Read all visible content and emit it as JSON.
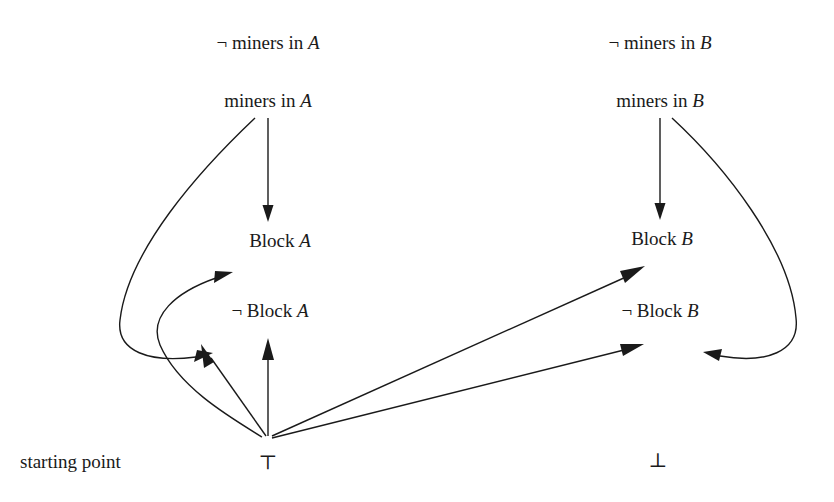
{
  "diagram": {
    "background_color": "#ffffff",
    "ink_color": "#1a1a1a",
    "side_label": "starting point",
    "nodes": [
      {
        "id": "not_miners_a",
        "text_plain": "¬ miners in A",
        "prefix": "¬ miners in ",
        "italic": "A",
        "x": 268,
        "y": 42
      },
      {
        "id": "miners_a",
        "text_plain": "miners in A",
        "prefix": "miners in ",
        "italic": "A",
        "x": 268,
        "y": 100
      },
      {
        "id": "not_miners_b",
        "text_plain": "¬ miners in B",
        "prefix": "¬ miners in ",
        "italic": "B",
        "x": 660,
        "y": 42
      },
      {
        "id": "miners_b",
        "text_plain": "miners in B",
        "prefix": "miners in ",
        "italic": "B",
        "x": 660,
        "y": 100
      },
      {
        "id": "block_a",
        "text_plain": "Block A",
        "prefix": "Block ",
        "italic": "A",
        "x": 280,
        "y": 240
      },
      {
        "id": "not_block_a",
        "text_plain": "¬ Block A",
        "prefix": "¬ Block ",
        "italic": "A",
        "x": 270,
        "y": 310
      },
      {
        "id": "block_b",
        "text_plain": "Block B",
        "prefix": "Block ",
        "italic": "B",
        "x": 662,
        "y": 238
      },
      {
        "id": "not_block_b",
        "text_plain": "¬ Block B",
        "prefix": "¬ Block ",
        "italic": "B",
        "x": 660,
        "y": 310
      },
      {
        "id": "top",
        "text_plain": "⊤",
        "prefix": "⊤",
        "italic": "",
        "x": 268,
        "y": 462
      },
      {
        "id": "bottom",
        "text_plain": "⊥",
        "prefix": "⊥",
        "italic": "",
        "x": 658,
        "y": 460
      }
    ],
    "edges": [
      {
        "id": "edge-miners-a-to-block-a",
        "from": "miners_a",
        "to": "block_a",
        "shape": "straight-vertical"
      },
      {
        "id": "edge-miners-a-to-not-block-a",
        "from": "miners_a",
        "to": "not_block_a",
        "shape": "left-outer-curve"
      },
      {
        "id": "edge-top-to-block-a",
        "from": "top",
        "to": "block_a",
        "shape": "left-inner-curve"
      },
      {
        "id": "edge-top-to-not-block-a-line",
        "from": "top",
        "to": "not_block_a",
        "shape": "straight-diagonal"
      },
      {
        "id": "edge-top-to-not-block-a-vert",
        "from": "top",
        "to": "not_block_a",
        "shape": "straight-vertical"
      },
      {
        "id": "edge-miners-b-to-block-b",
        "from": "miners_b",
        "to": "block_b",
        "shape": "straight-vertical"
      },
      {
        "id": "edge-miners-b-to-not-block-b",
        "from": "miners_b",
        "to": "not_block_b",
        "shape": "right-outer-curve"
      },
      {
        "id": "edge-top-to-block-b",
        "from": "top",
        "to": "block_b",
        "shape": "straight-diagonal"
      },
      {
        "id": "edge-top-to-not-block-b",
        "from": "top",
        "to": "not_block_b",
        "shape": "straight-diagonal"
      }
    ]
  }
}
